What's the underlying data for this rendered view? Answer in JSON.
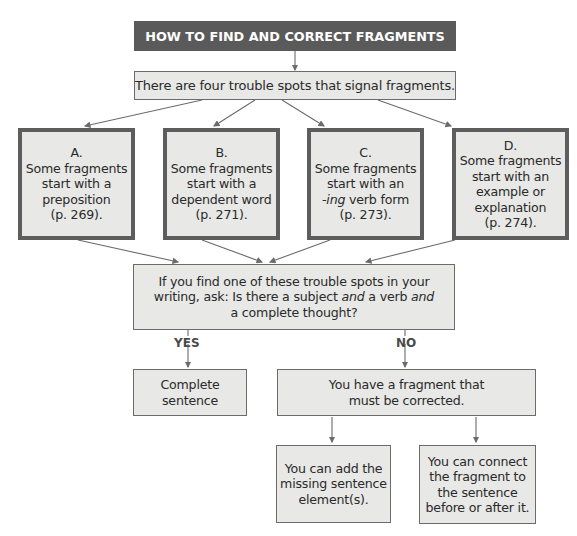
{
  "title": "HOW TO FIND AND CORRECT FRAGMENTS",
  "intro": "There are four trouble spots that signal fragments.",
  "trouble_spots": [
    {
      "letter": "A.",
      "lines": [
        "Some fragments",
        "start with a",
        "preposition",
        "(p. 269)."
      ]
    },
    {
      "letter": "B.",
      "lines": [
        "Some fragments",
        "start with a",
        "dependent word",
        "(p. 271)."
      ]
    },
    {
      "letter": "C.",
      "lines": [
        "Some fragments",
        "start with an",
        "-ing verb form",
        "(p. 273)."
      ]
    },
    {
      "letter": "D.",
      "lines": [
        "Some fragments",
        "start with an",
        "example or",
        "explanation",
        "(p. 274)."
      ]
    }
  ],
  "question": {
    "line1": "If you find one of these trouble spots in your",
    "line2_a": "writing, ask: Is there a subject ",
    "line2_b": "and",
    "line2_c": " a verb ",
    "line2_d": "and",
    "line3": "a complete thought?"
  },
  "branches": {
    "yes": "YES",
    "no": "NO"
  },
  "yes_result": [
    "Complete",
    "sentence"
  ],
  "no_result": [
    "You have a fragment that",
    "must be corrected."
  ],
  "fixes": [
    {
      "lines": [
        "You can add the",
        "missing sentence",
        "element(s)."
      ]
    },
    {
      "lines": [
        "You can connect",
        "the fragment to",
        "the sentence",
        "before or after it."
      ]
    }
  ],
  "colors": {
    "title_bg": "#5a5a5a",
    "box_bg": "#e8e8e6",
    "border": "#6b6b6b",
    "arrow": "#6b6b6b"
  }
}
